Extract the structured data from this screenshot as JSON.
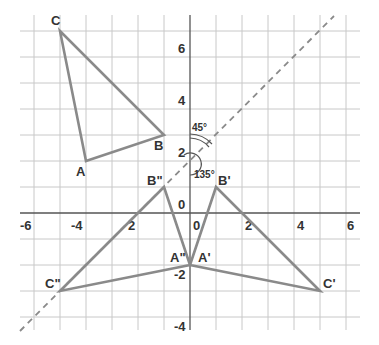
{
  "grid": {
    "x_min": -6,
    "x_max": 6,
    "y_min": -4.5,
    "y_max": 7.5,
    "origin_px": [
      190,
      213
    ],
    "unit_px": 26
  },
  "axes": {
    "x_ticks": [
      {
        "value": -6,
        "label": "-6"
      },
      {
        "value": -4,
        "label": "-4"
      },
      {
        "value": -2,
        "label": "2"
      },
      {
        "value": 0,
        "label": "0"
      },
      {
        "value": 2,
        "label": "2"
      },
      {
        "value": 4,
        "label": "4"
      },
      {
        "value": 6,
        "label": "6"
      }
    ],
    "y_ticks": [
      {
        "value": 6,
        "label": "6"
      },
      {
        "value": 4,
        "label": "4"
      },
      {
        "value": 2,
        "label": "2"
      },
      {
        "value": 0,
        "label": "0"
      },
      {
        "value": -2,
        "label": "-2"
      },
      {
        "value": -4,
        "label": "-4"
      }
    ]
  },
  "triangles": [
    {
      "name": "ABC",
      "points": {
        "A": [
          -4,
          2
        ],
        "B": [
          -1,
          3
        ],
        "C": [
          -5,
          7
        ]
      }
    },
    {
      "name": "A'B'C'",
      "points": {
        "A'": [
          0,
          -2
        ],
        "B'": [
          1,
          1
        ],
        "C'": [
          5,
          -3
        ]
      }
    },
    {
      "name": "A''B''C''",
      "points": {
        "A''": [
          0,
          -2
        ],
        "B''": [
          -1,
          1
        ],
        "C''": [
          -5,
          -3
        ]
      }
    }
  ],
  "labels": {
    "A": "A",
    "B": "B",
    "C": "C",
    "A1": "A'",
    "B1": "B'",
    "C1": "C'",
    "A2": "A\"",
    "B2": "B\"",
    "C2": "C\""
  },
  "mirror_line": {
    "equation": "y = x + 2",
    "style": "dashed"
  },
  "angles": {
    "upper": "45°",
    "lower": "135°"
  }
}
